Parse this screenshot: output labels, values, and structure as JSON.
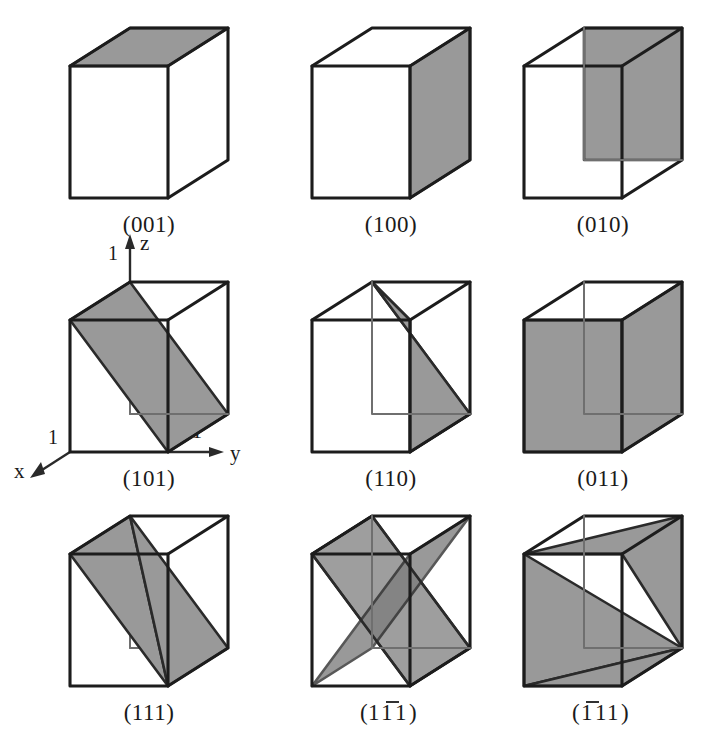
{
  "figure": {
    "background_color": "#ffffff",
    "plane_fill_color": "#999999",
    "plane_fill_dark_color": "#7d7d7d",
    "edge_color": "#1c1c1c",
    "hidden_edge_color": "#6f6f6f",
    "rows": 3,
    "columns": 3
  },
  "axes": {
    "shown_on_cell": "(101)",
    "x": {
      "label": "x",
      "tick": "1"
    },
    "y": {
      "label": "y",
      "tick": "1"
    },
    "z": {
      "label": "z",
      "tick": "1"
    }
  },
  "cells": [
    {
      "id": "cell-001",
      "label": "(001)",
      "row": 1,
      "col": 1,
      "plane_type": "top-face",
      "indices": [
        0,
        0,
        1
      ]
    },
    {
      "id": "cell-100",
      "label": "(100)",
      "row": 1,
      "col": 2,
      "plane_type": "right-face",
      "indices": [
        1,
        0,
        0
      ]
    },
    {
      "id": "cell-010",
      "label": "(010)",
      "row": 1,
      "col": 3,
      "plane_type": "back-face",
      "indices": [
        0,
        1,
        0
      ]
    },
    {
      "id": "cell-101",
      "label": "(101)",
      "row": 2,
      "col": 1,
      "plane_type": "diagonal-xz",
      "indices": [
        1,
        0,
        1
      ]
    },
    {
      "id": "cell-110",
      "label": "(110)",
      "row": 2,
      "col": 2,
      "plane_type": "diagonal-vertical",
      "indices": [
        1,
        1,
        0
      ]
    },
    {
      "id": "cell-011",
      "label": "(011)",
      "row": 2,
      "col": 3,
      "plane_type": "diagonal-yz",
      "indices": [
        0,
        1,
        1
      ]
    },
    {
      "id": "cell-111",
      "label": "(111)",
      "row": 3,
      "col": 1,
      "plane_type": "triangle",
      "indices": [
        1,
        1,
        1
      ]
    },
    {
      "id": "cell-1b11",
      "label": "(11̱1)",
      "label_parts": [
        "(",
        "1",
        "1",
        "1",
        ")"
      ],
      "overbar_index": 2,
      "row": 3,
      "col": 2,
      "plane_type": "double-triangle",
      "indices": [
        1,
        -1,
        1
      ]
    },
    {
      "id": "cell-b111",
      "label": "(1̱ 1 1)",
      "label_parts": [
        "(",
        "1",
        "1",
        "1",
        ")"
      ],
      "overbar_index": 1,
      "row": 3,
      "col": 3,
      "plane_type": "double-triangle-alt",
      "indices": [
        -1,
        1,
        1
      ]
    }
  ],
  "labels": {
    "l001": "(001)",
    "l100": "(100)",
    "l010": "(010)",
    "l101": "(101)",
    "l110": "(110)",
    "l011": "(011)",
    "l111": "(111)",
    "l1b11_open": "(",
    "l1b11_a": "1",
    "l1b11_b": "1",
    "l1b11_c": "1",
    "l1b11_close": ")",
    "lb111_open": "(",
    "lb111_a": "1",
    "lb111_b": "1",
    "lb111_c": "1",
    "lb111_close": ")"
  }
}
